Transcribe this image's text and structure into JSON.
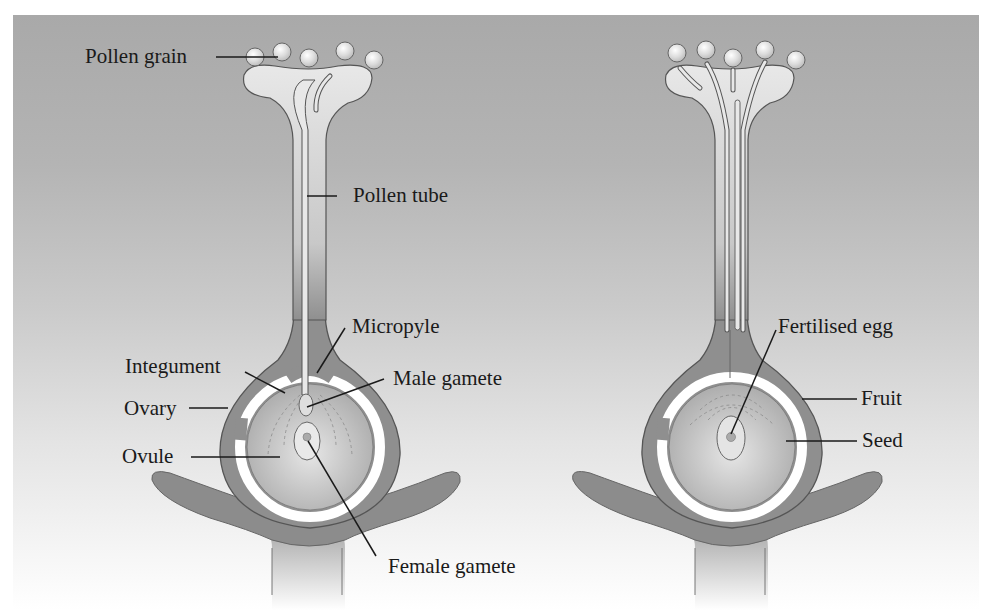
{
  "figure": {
    "type": "biology-diagram",
    "panels": [
      {
        "id": "before-fertilisation",
        "labels": [
          {
            "key": "pollen_grain",
            "text": "Pollen grain"
          },
          {
            "key": "pollen_tube",
            "text": "Pollen tube"
          },
          {
            "key": "micropyle",
            "text": "Micropyle"
          },
          {
            "key": "integument",
            "text": "Integument"
          },
          {
            "key": "male_gamete",
            "text": "Male gamete"
          },
          {
            "key": "ovary",
            "text": "Ovary"
          },
          {
            "key": "ovule",
            "text": "Ovule"
          },
          {
            "key": "female_gamete",
            "text": "Female gamete"
          }
        ]
      },
      {
        "id": "after-fertilisation",
        "labels": [
          {
            "key": "fertilised_egg",
            "text": "Fertilised egg"
          },
          {
            "key": "fruit",
            "text": "Fruit"
          },
          {
            "key": "seed",
            "text": "Seed"
          }
        ]
      }
    ]
  },
  "labels": {
    "pollen_grain": "Pollen grain",
    "pollen_tube": "Pollen tube",
    "micropyle": "Micropyle",
    "integument": "Integument",
    "male_gamete": "Male gamete",
    "ovary": "Ovary",
    "ovule": "Ovule",
    "female_gamete": "Female gamete",
    "fertilised_egg": "Fertilised egg",
    "fruit": "Fruit",
    "seed": "Seed"
  },
  "colors": {
    "background_top": "#a9a9a9",
    "background_bottom": "#ffffff",
    "tissue_dark": "#8f8f8f",
    "tissue_light": "#e2e2e2",
    "outline": "#555555",
    "leader_line": "#1a1a1a"
  }
}
